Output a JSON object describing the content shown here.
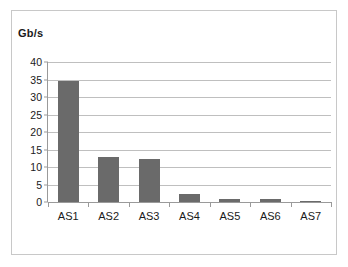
{
  "chart_data": {
    "type": "bar",
    "title": "",
    "subtitle": "",
    "xlabel": "",
    "ylabel": "Gb/s",
    "categories": [
      "AS1",
      "AS2",
      "AS3",
      "AS4",
      "AS5",
      "AS6",
      "AS7"
    ],
    "values": [
      34.7,
      13.0,
      12.3,
      2.4,
      0.8,
      0.8,
      0.2
    ],
    "ylim": [
      0,
      40
    ],
    "ytick_step": 5,
    "ytick_labels": [
      "40",
      "35",
      "30",
      "25",
      "20",
      "15",
      "10",
      "5",
      "0"
    ],
    "ytick_values": [
      40,
      35,
      30,
      25,
      20,
      15,
      10,
      5,
      0
    ],
    "grid": true,
    "grid_orientation": "horizontal",
    "legend": false,
    "legend_position": "none",
    "series": [
      {
        "name": "Gb/s",
        "values": [
          34.7,
          13.0,
          12.3,
          2.4,
          0.8,
          0.8,
          0.2
        ]
      }
    ],
    "colors": {
      "bar": "#6a6a6a",
      "gridline": "#bfbfbf",
      "axis": "#9a9a9a",
      "frame_border": "#c8c8c8",
      "text": "#1a1a1a",
      "background": "#ffffff"
    }
  }
}
